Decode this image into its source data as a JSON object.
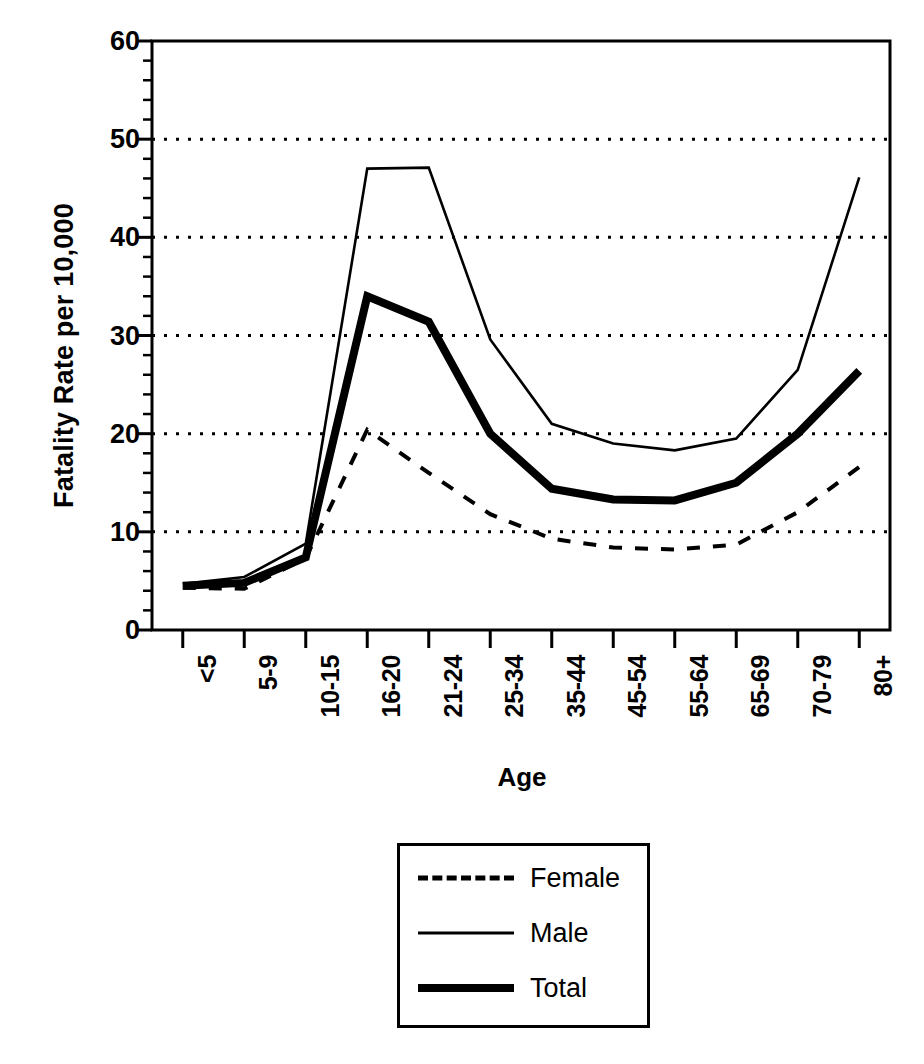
{
  "chart_data": {
    "type": "line",
    "title": "",
    "xlabel": "Age",
    "ylabel": "Fatality Rate per 10,000",
    "categories": [
      "<5",
      "5-9",
      "10-15",
      "16-20",
      "21-24",
      "25-34",
      "35-44",
      "45-54",
      "55-64",
      "65-69",
      "70-79",
      "80+"
    ],
    "ylim": [
      0,
      60
    ],
    "yticks": [
      0,
      10,
      20,
      30,
      40,
      50,
      60
    ],
    "ytick_labels": [
      "0",
      "10",
      "20",
      "30",
      "40",
      "50",
      "60"
    ],
    "y_minor_tick_step": 2,
    "grid": "horizontal-dotted",
    "legend_position": "below-center",
    "series": [
      {
        "name": "Female",
        "style": "dashed",
        "linewidth": 3,
        "values": [
          4.3,
          4.2,
          7.3,
          20.4,
          16.0,
          11.8,
          9.3,
          8.4,
          8.2,
          8.7,
          12.0,
          16.6
        ]
      },
      {
        "name": "Male",
        "style": "thin-solid",
        "linewidth": 2,
        "values": [
          4.7,
          5.4,
          8.8,
          47.0,
          47.1,
          29.6,
          21.0,
          19.0,
          18.3,
          19.5,
          26.5,
          46.1
        ]
      },
      {
        "name": "Total",
        "style": "thick-solid",
        "linewidth": 7,
        "values": [
          4.5,
          4.8,
          7.4,
          34.0,
          31.4,
          20.0,
          14.4,
          13.3,
          13.2,
          15.0,
          20.0,
          26.4
        ]
      }
    ]
  },
  "axes": {
    "ylabel": "Fatality Rate per 10,000",
    "xlabel": "Age"
  },
  "legend": {
    "items": [
      {
        "label": "Female",
        "style": "dashed"
      },
      {
        "label": "Male",
        "style": "thin-solid"
      },
      {
        "label": "Total",
        "style": "thick-solid"
      }
    ]
  },
  "colors": {
    "ink": "#000000",
    "background": "#ffffff"
  }
}
